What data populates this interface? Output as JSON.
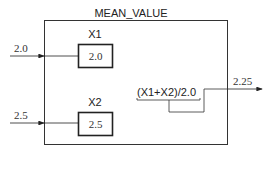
{
  "block": {
    "title": "MEAN_VALUE"
  },
  "inputs": [
    {
      "name": "X1",
      "value": "2.0",
      "input_label": "2.0"
    },
    {
      "name": "X2",
      "value": "2.5",
      "input_label": "2.5"
    }
  ],
  "formula": "(X1+X2)/2.0",
  "output": {
    "value": "2.25"
  },
  "colors": {
    "line": "#222222",
    "text": "#333333",
    "background": "#ffffff"
  }
}
